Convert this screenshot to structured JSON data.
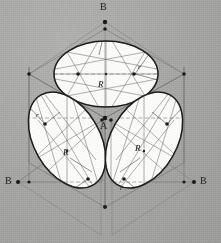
{
  "drawing": {
    "title": "Isometric four-center ellipse construction on a cube",
    "background_color": "#a9a9a7",
    "ink_color": "#2a2a2a",
    "construction_color": "#6d6d6d",
    "face_fill": "#fbfbfa",
    "width": 221,
    "height": 243
  },
  "labels": {
    "b_top": "B",
    "b_left": "B",
    "b_right": "B",
    "a_center": "A",
    "top_R": "R",
    "top_r": "r",
    "left_R": "R",
    "left_r": "r",
    "right_R": "R",
    "right_r": "r"
  },
  "label_positions": [
    {
      "name": "b-top-label",
      "text": "B",
      "x": 101,
      "y": 7,
      "style": "cap"
    },
    {
      "name": "a-center-label",
      "text": "A",
      "x": 101,
      "y": 120,
      "style": "cap"
    },
    {
      "name": "b-left-label",
      "text": "B",
      "x": 7,
      "y": 177,
      "style": "cap"
    },
    {
      "name": "b-right-label",
      "text": "B",
      "x": 202,
      "y": 177,
      "style": "cap"
    },
    {
      "name": "top-big-radius-label",
      "text": "R",
      "x": 98,
      "y": 82,
      "style": "R"
    },
    {
      "name": "top-small-radius-label",
      "text": "r",
      "x": 139,
      "y": 67,
      "style": "r"
    },
    {
      "name": "left-big-radius-label",
      "text": "R",
      "x": 64,
      "y": 151,
      "style": "R"
    },
    {
      "name": "left-small-radius-label",
      "text": "r",
      "x": 37,
      "y": 115,
      "style": "r"
    },
    {
      "name": "right-big-radius-label",
      "text": "R",
      "x": 136,
      "y": 147,
      "style": "R"
    },
    {
      "name": "right-small-radius-label",
      "text": "r",
      "x": 122,
      "y": 188,
      "style": "r"
    }
  ],
  "faces": [
    {
      "name": "top-face",
      "kind": "rhombus",
      "vertices": [
        [
          105,
          29
        ],
        [
          184,
          74
        ],
        [
          105,
          118
        ],
        [
          29,
          74
        ]
      ],
      "ellipse": {
        "cx": 106,
        "cy": 74,
        "rx": 52,
        "ry": 33,
        "rotation": 0
      }
    },
    {
      "name": "left-face",
      "kind": "rhombus",
      "vertices": [
        [
          29,
          74
        ],
        [
          105,
          118
        ],
        [
          105,
          207
        ],
        [
          29,
          163
        ]
      ],
      "ellipse": {
        "cx": 67,
        "cy": 140,
        "rx": 33,
        "ry": 52,
        "rotation": -30
      }
    },
    {
      "name": "right-face",
      "kind": "rhombus",
      "vertices": [
        [
          105,
          118
        ],
        [
          184,
          74
        ],
        [
          184,
          163
        ],
        [
          105,
          207
        ]
      ],
      "ellipse": {
        "cx": 144,
        "cy": 140,
        "rx": 33,
        "ry": 52,
        "rotation": 30
      }
    }
  ],
  "key_points": {
    "apex_top_B": [
      105,
      22
    ],
    "center_A": [
      105,
      118
    ],
    "left_B": [
      18,
      182
    ],
    "right_B": [
      194,
      182
    ]
  }
}
